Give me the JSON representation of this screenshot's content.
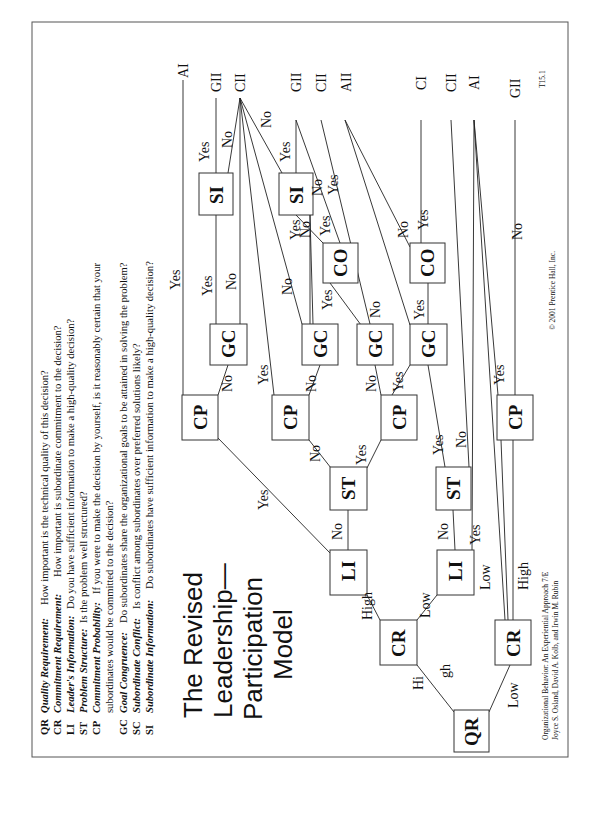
{
  "slide": {
    "id_label": "T15.1",
    "title_lines": [
      "The Revised",
      "Leadership—",
      "Participation",
      "Model"
    ],
    "copyright": "© 2001 Prentice Hall, Inc.",
    "citation_lines": [
      "Organizational Behavior: An Experiential Approach 7/E",
      "Joyce S. Osland, David A. Kolb, and Irwin M. Rubin"
    ],
    "orientation": "rotated 90° counter-clockwise"
  },
  "legend": [
    {
      "code": "QR",
      "term": "Quality Requirement:",
      "text": "How important is the technical quality of this decision?"
    },
    {
      "code": "CR",
      "term": "Commitment Requirement:",
      "text": "How important is subordinate commitment to the decision?"
    },
    {
      "code": "LI",
      "term": "Leader's Information:",
      "text": "Do you have sufficient information to make a high-quality decision?"
    },
    {
      "code": "ST",
      "term": "Problem Structure:",
      "text": "Is the problem well structured?"
    },
    {
      "code": "CP",
      "term": "Commitment Probability:",
      "text": "If you were to make the decision by yourself, is it reasonably certain that your",
      "text2": "subordinates would be committed to the decision?"
    },
    {
      "code": "GC",
      "term": "Goal Congruence:",
      "text": "Do subordinates share the organizational goals to be attained in solving the problem?"
    },
    {
      "code": "SC",
      "term": "Subordinate Conflict:",
      "text": "Is conflict among subordinates over preferred solutions likely?"
    },
    {
      "code": "SI",
      "term": "Subordinate Information:",
      "text": "Do subordinates have sufficient information to make a high-quality decision?"
    }
  ],
  "nodes": {
    "qr": "QR",
    "cr_high": "CR",
    "cr_low": "CR",
    "li_1": "LI",
    "li_2": "LI",
    "st_1": "ST",
    "st_2": "ST",
    "cp_1": "CP",
    "cp_2": "CP",
    "cp_3": "CP",
    "cp_4": "CP",
    "gc_1": "GC",
    "gc_2": "GC",
    "gc_3": "GC",
    "gc_4": "GC",
    "si_1": "SI",
    "si_2": "SI",
    "co_1": "CO",
    "co_2": "CO"
  },
  "outcomes": [
    "AI",
    "GII",
    "CII",
    "GII",
    "CII",
    "AII",
    "CI",
    "CII",
    "AI",
    "GII"
  ],
  "edge_labels": {
    "qr_high": [
      "Hi",
      "gh"
    ],
    "qr_low": "Low",
    "cr_high_high": "High",
    "cr_high_low": "Low",
    "cr_low_low": "Low",
    "cr_low_high": "High",
    "li1_yes": "Yes",
    "li1_no": "No",
    "li2_yes": "Yes",
    "li2_no": "No",
    "st1_no": "No",
    "st1_yes": "Yes",
    "st2_yes": "Yes",
    "st2_no": "No",
    "cp1_yes": "Yes",
    "cp1_no": "No",
    "cp2_yes": "Yes",
    "cp2_no": "No",
    "cp3_no": "No",
    "cp3_yes": "Yes",
    "cp4_yes": "Yes",
    "cp4_no": "No",
    "gc1_yes": "Yes",
    "gc1_no": "No",
    "gc2_no": "No",
    "gc2_yes": "Yes",
    "gc3_yes": "Yes",
    "gc4_no": "No",
    "gc4_yes": "Yes",
    "si1_yes": "Yes",
    "si1_no": "No",
    "si2_yes": "Yes",
    "si2_no": "No",
    "co1_no": "No",
    "co1_yes": "Yes",
    "co2_no": "No",
    "co2_yes": "Yes"
  }
}
